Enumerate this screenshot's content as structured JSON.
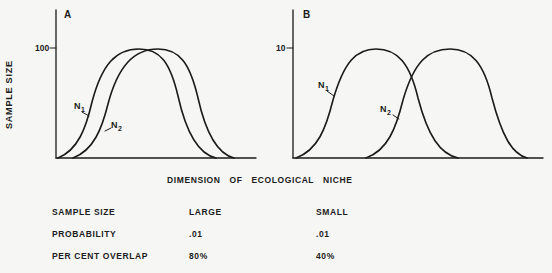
{
  "figure": {
    "ylabel": "SAMPLE SIZE",
    "xlabel": "DIMENSION OF ECOLOGICAL NICHE",
    "panels": [
      {
        "id": "A",
        "ytick": "100",
        "curve_labels": [
          "N1",
          "N2"
        ]
      },
      {
        "id": "B",
        "ytick": "10",
        "curve_labels": [
          "N1",
          "N2"
        ]
      }
    ]
  },
  "table": {
    "rows": [
      {
        "label": "SAMPLE SIZE",
        "a": "LARGE",
        "b": "SMALL"
      },
      {
        "label": "PROBABILITY",
        "a": ".01",
        "b": ".01"
      },
      {
        "label": "PER CENT OVERLAP",
        "a": "80%",
        "b": "40%"
      }
    ]
  },
  "chart_data": [
    {
      "type": "line",
      "title": "A",
      "xlabel": "DIMENSION OF ECOLOGICAL NICHE",
      "ylabel": "SAMPLE SIZE",
      "yticks": [
        "100"
      ],
      "ylim": [
        0,
        100
      ],
      "grid": false,
      "series": [
        {
          "name": "N1",
          "shape": "bell",
          "x_start": 0.01,
          "x_peak": 0.42,
          "x_end": 0.8,
          "peak": 100
        },
        {
          "name": "N2",
          "shape": "bell",
          "x_start": 0.09,
          "x_peak": 0.51,
          "x_end": 0.89,
          "peak": 100
        }
      ],
      "annotations": {
        "sample_size": "LARGE",
        "probability": ".01",
        "per_cent_overlap": "80%"
      }
    },
    {
      "type": "line",
      "title": "B",
      "xlabel": "DIMENSION OF ECOLOGICAL NICHE",
      "ylabel": "SAMPLE SIZE",
      "yticks": [
        "10"
      ],
      "ylim": [
        0,
        10
      ],
      "grid": false,
      "series": [
        {
          "name": "N1",
          "shape": "bell",
          "x_start": 0.01,
          "x_peak": 0.33,
          "x_end": 0.66,
          "peak": 10
        },
        {
          "name": "N2",
          "shape": "bell",
          "x_start": 0.29,
          "x_peak": 0.63,
          "x_end": 0.94,
          "peak": 10
        }
      ],
      "annotations": {
        "sample_size": "SMALL",
        "probability": ".01",
        "per_cent_overlap": "40%"
      }
    }
  ]
}
